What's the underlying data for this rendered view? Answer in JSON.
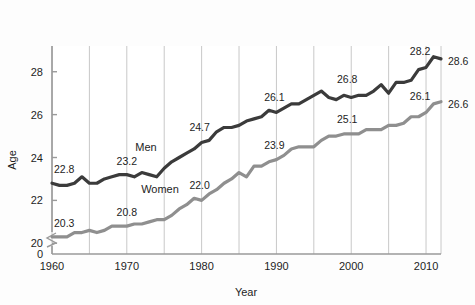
{
  "figure": {
    "background_color": "#fdfdfd",
    "plot_background_color": "#ffffff"
  },
  "axes": {
    "y_title": "Age",
    "x_title": "Year",
    "y_ticks": [
      "0",
      "20",
      "22",
      "24",
      "26",
      "28"
    ],
    "x_ticks": [
      "1960",
      "1970",
      "1980",
      "1990",
      "2000",
      "2010"
    ],
    "y_axis_break": true,
    "grid": "vertical-only"
  },
  "legend_inline": {
    "men_label": "Men",
    "women_label": "Women"
  },
  "colors": {
    "men_line": "#3b3b3b",
    "women_line": "#8f8f8f",
    "grid": "#c8c8c8",
    "axis": "#9a9a9a",
    "text": "#1d1d1d"
  },
  "chart_data": {
    "type": "line",
    "title": "",
    "subtitle": "",
    "xlabel": "Year",
    "ylabel": "Age",
    "xlim": [
      1960,
      2012
    ],
    "ylim": [
      19.5,
      29.2
    ],
    "grid": true,
    "grid_axis": "x",
    "grid_interval": 5,
    "legend_position": "inline-on-lines",
    "x": [
      1960,
      1961,
      1962,
      1963,
      1964,
      1965,
      1966,
      1967,
      1968,
      1969,
      1970,
      1971,
      1972,
      1973,
      1974,
      1975,
      1976,
      1977,
      1978,
      1979,
      1980,
      1981,
      1982,
      1983,
      1984,
      1985,
      1986,
      1987,
      1988,
      1989,
      1990,
      1991,
      1992,
      1993,
      1994,
      1995,
      1996,
      1997,
      1998,
      1999,
      2000,
      2001,
      2002,
      2003,
      2004,
      2005,
      2006,
      2007,
      2008,
      2009,
      2010,
      2011,
      2012
    ],
    "series": [
      {
        "name": "Men",
        "color": "#3b3b3b",
        "values": [
          22.8,
          22.7,
          22.7,
          22.8,
          23.1,
          22.8,
          22.8,
          23.0,
          23.1,
          23.2,
          23.2,
          23.1,
          23.3,
          23.2,
          23.1,
          23.5,
          23.8,
          24.0,
          24.2,
          24.4,
          24.7,
          24.8,
          25.2,
          25.4,
          25.4,
          25.5,
          25.7,
          25.8,
          25.9,
          26.2,
          26.1,
          26.3,
          26.5,
          26.5,
          26.7,
          26.9,
          27.1,
          26.8,
          26.7,
          26.9,
          26.8,
          26.9,
          26.9,
          27.1,
          27.4,
          27.0,
          27.5,
          27.5,
          27.6,
          28.1,
          28.2,
          28.7,
          28.6
        ]
      },
      {
        "name": "Women",
        "color": "#8f8f8f",
        "values": [
          20.3,
          20.3,
          20.3,
          20.5,
          20.5,
          20.6,
          20.5,
          20.6,
          20.8,
          20.8,
          20.8,
          20.9,
          20.9,
          21.0,
          21.1,
          21.1,
          21.3,
          21.6,
          21.8,
          22.1,
          22.0,
          22.3,
          22.5,
          22.8,
          23.0,
          23.3,
          23.1,
          23.6,
          23.6,
          23.8,
          23.9,
          24.1,
          24.4,
          24.5,
          24.5,
          24.5,
          24.8,
          25.0,
          25.0,
          25.1,
          25.1,
          25.1,
          25.3,
          25.3,
          25.3,
          25.5,
          25.5,
          25.6,
          25.9,
          25.9,
          26.1,
          26.5,
          26.6
        ]
      }
    ],
    "point_labels": [
      {
        "series": "Men",
        "year": 1960,
        "value": 22.8,
        "text": "22.8"
      },
      {
        "series": "Men",
        "year": 1970,
        "value": 23.2,
        "text": "23.2"
      },
      {
        "series": "Men",
        "year": 1980,
        "value": 24.7,
        "text": "24.7"
      },
      {
        "series": "Men",
        "year": 1990,
        "value": 26.1,
        "text": "26.1"
      },
      {
        "series": "Men",
        "year": 2000,
        "value": 26.8,
        "text": "26.8"
      },
      {
        "series": "Men",
        "year": 2010,
        "value": 28.2,
        "text": "28.2"
      },
      {
        "series": "Men",
        "year": 2012,
        "value": 28.6,
        "text": "28.6"
      },
      {
        "series": "Women",
        "year": 1960,
        "value": 20.3,
        "text": "20.3"
      },
      {
        "series": "Women",
        "year": 1970,
        "value": 20.8,
        "text": "20.8"
      },
      {
        "series": "Women",
        "year": 1980,
        "value": 22.0,
        "text": "22.0"
      },
      {
        "series": "Women",
        "year": 1990,
        "value": 23.9,
        "text": "23.9"
      },
      {
        "series": "Women",
        "year": 2000,
        "value": 25.1,
        "text": "25.1"
      },
      {
        "series": "Women",
        "year": 2010,
        "value": 26.1,
        "text": "26.1"
      },
      {
        "series": "Women",
        "year": 2012,
        "value": 26.6,
        "text": "26.6"
      }
    ]
  }
}
